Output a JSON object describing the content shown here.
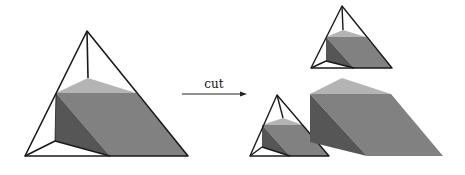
{
  "arrow": {
    "label": "cut"
  },
  "colors": {
    "light_face": "#b4b4b4",
    "mid_face": "#818181",
    "dark_face": "#565656",
    "edge": "#1a1a1a",
    "background": "#ffffff"
  },
  "figures": [
    {
      "name": "original-tetrahedron-with-prism",
      "position": "left"
    },
    {
      "name": "cut-piece-top-tetrahedron",
      "position": "right-top"
    },
    {
      "name": "cut-piece-bottom-tetrahedron",
      "position": "right-bottom-left"
    },
    {
      "name": "cut-piece-prism",
      "position": "right-bottom-right"
    }
  ]
}
